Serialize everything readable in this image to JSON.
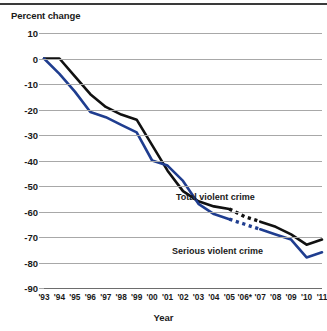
{
  "chart_data": {
    "type": "line",
    "title": "",
    "xlabel": "Year",
    "ylabel": "Percent change",
    "ylim": [
      -90,
      10
    ],
    "yticks": [
      10,
      0,
      -10,
      -20,
      -30,
      -40,
      -50,
      -60,
      -70,
      -80,
      -90
    ],
    "ytick_labels": [
      "10",
      "0",
      "-10",
      "-20",
      "-30",
      "-40",
      "-50",
      "-60",
      "-70",
      "-80",
      "-90"
    ],
    "grid": true,
    "legend_position": "inline-annotation",
    "categories": [
      "'93",
      "'94",
      "'95",
      "'96",
      "'97",
      "'98",
      "'99",
      "'00",
      "'01",
      "'02",
      "'03",
      "'04",
      "'05",
      "'06*",
      "'07",
      "'08",
      "'09",
      "'10",
      "'11"
    ],
    "x_values": [
      1993,
      1994,
      1995,
      1996,
      1997,
      1998,
      1999,
      2000,
      2001,
      2002,
      2003,
      2004,
      2005,
      2006,
      2007,
      2008,
      2009,
      2010,
      2011
    ],
    "series": [
      {
        "name": "Total violent crime",
        "color": "#111111",
        "values": [
          0,
          0,
          -7,
          -14,
          -19,
          -22,
          -24,
          -34,
          -44,
          -52,
          -56,
          -58,
          -59,
          -62,
          -64,
          -66,
          -69,
          -73,
          -71
        ],
        "dashed_segment": [
          2005,
          2007
        ],
        "note": "Dashed between '05 and '07 due to survey redesign in 2006"
      },
      {
        "name": "Serious violent crime",
        "color": "#1f3d8f",
        "values": [
          0,
          -6,
          -13,
          -21,
          -23,
          -26,
          -29,
          -40,
          -42,
          -48,
          -57,
          -61,
          -63,
          -65,
          -67,
          -69,
          -71,
          -78,
          -76
        ],
        "dashed_segment": [
          2005,
          2007
        ],
        "note": "Dashed between '05 and '07 due to survey redesign in 2006"
      }
    ],
    "annotations": [
      {
        "text": "Total violent crime",
        "series": "Total violent crime"
      },
      {
        "text": "Serious violent crime",
        "series": "Serious violent crime"
      }
    ]
  },
  "axes": {
    "y_title": "Percent change",
    "x_title": "Year"
  }
}
